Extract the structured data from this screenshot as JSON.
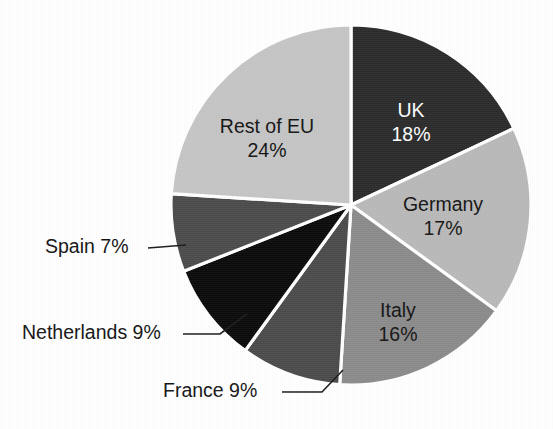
{
  "chart_data": {
    "type": "pie",
    "title": "",
    "subtitle": "",
    "xlabel": "",
    "ylabel": "",
    "legend_position": "none",
    "grid": false,
    "label_format": "name + percent",
    "total_percent": 100,
    "start_angle_deg": 0,
    "direction": "clockwise",
    "categories": [
      "UK",
      "Germany",
      "Italy",
      "France",
      "Netherlands",
      "Spain",
      "Rest of EU"
    ],
    "values": [
      18,
      17,
      16,
      9,
      9,
      7,
      24
    ],
    "slices": [
      {
        "name": "UK",
        "value": 18,
        "percent_label": "18%",
        "label_line1": "UK",
        "label_line2": "18%",
        "color": "#2b2b2b",
        "text_color": "#ffffff",
        "label_placement": "inside",
        "label_x": 411,
        "label_y": 112,
        "start_deg": 0,
        "end_deg": 64.8
      },
      {
        "name": "Germany",
        "value": 17,
        "percent_label": "17%",
        "label_line1": "Germany",
        "label_line2": "17%",
        "color": "#b9b9b9",
        "text_color": "#141414",
        "label_placement": "inside",
        "label_x": 443,
        "label_y": 206,
        "start_deg": 64.8,
        "end_deg": 126.0
      },
      {
        "name": "Italy",
        "value": 16,
        "percent_label": "16%",
        "label_line1": "Italy",
        "label_line2": "16%",
        "color": "#8b8b8b",
        "text_color": "#141414",
        "label_placement": "inside",
        "label_x": 398,
        "label_y": 312,
        "start_deg": 126.0,
        "end_deg": 183.6
      },
      {
        "name": "France",
        "value": 9,
        "percent_label": "9%",
        "label_text": "France 9%",
        "color": "#4b4b4b",
        "text_color": "#141414",
        "label_placement": "outside",
        "label_x": 163,
        "label_y": 392,
        "leader_points": "282,392 322,392 343,370",
        "start_deg": 183.6,
        "end_deg": 216.0
      },
      {
        "name": "Netherlands",
        "value": 9,
        "percent_label": "9%",
        "label_text": "Netherlands 9%",
        "color": "#0b0b0b",
        "text_color": "#141414",
        "label_placement": "outside",
        "label_x": 22,
        "label_y": 334,
        "leader_points": "183,334 220,334 247,314",
        "start_deg": 216.0,
        "end_deg": 248.4
      },
      {
        "name": "Spain",
        "value": 7,
        "percent_label": "7%",
        "label_text": "Spain 7%",
        "color": "#4b4b4b",
        "text_color": "#141414",
        "label_placement": "outside",
        "label_x": 45,
        "label_y": 248,
        "leader_points": "148,248 186,245",
        "start_deg": 248.4,
        "end_deg": 273.6
      },
      {
        "name": "Rest of EU",
        "value": 24,
        "percent_label": "24%",
        "label_line1": "Rest of EU",
        "label_line2": "24%",
        "color": "#c5c5c5",
        "text_color": "#141414",
        "label_placement": "inside",
        "label_x": 267,
        "label_y": 128,
        "start_deg": 273.6,
        "end_deg": 360.0
      }
    ],
    "geometry": {
      "center_x": 351,
      "center_y": 205,
      "radius": 180
    },
    "background_color": "#ffffff"
  }
}
